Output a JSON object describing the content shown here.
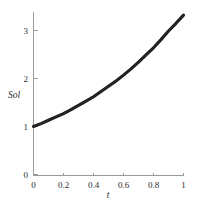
{
  "chart_data": {
    "type": "line",
    "title": "",
    "xlabel": "t",
    "ylabel": "Sol",
    "xlim": [
      0,
      1
    ],
    "ylim": [
      0,
      3.45
    ],
    "grid": false,
    "legend": null,
    "x_ticks": [
      "0",
      "0.2",
      "0.4",
      "0.6",
      "0.8",
      "1"
    ],
    "x_tick_values": [
      0,
      0.2,
      0.4,
      0.6,
      0.8,
      1
    ],
    "y_ticks": [
      "0",
      "1",
      "2",
      "3"
    ],
    "y_tick_values": [
      0,
      1,
      2,
      3
    ],
    "series": [
      {
        "name": "Sol",
        "color": "#181818",
        "x": [
          0,
          0.05,
          0.1,
          0.15,
          0.2,
          0.25,
          0.3,
          0.35,
          0.4,
          0.45,
          0.5,
          0.55,
          0.6,
          0.65,
          0.7,
          0.75,
          0.8,
          0.85,
          0.9,
          0.95,
          1
        ],
        "values": [
          1.0,
          1.06,
          1.13,
          1.2,
          1.27,
          1.35,
          1.44,
          1.53,
          1.62,
          1.73,
          1.84,
          1.95,
          2.07,
          2.2,
          2.34,
          2.49,
          2.64,
          2.81,
          2.99,
          3.15,
          3.32
        ]
      }
    ]
  },
  "axis": {
    "y_label": "Sol",
    "x_label": "t"
  }
}
